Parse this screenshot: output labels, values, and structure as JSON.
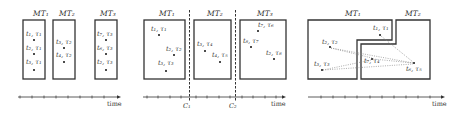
{
  "panels": [
    {
      "id": "a",
      "boxes": [
        {
          "title": "MT₁",
          "items": [
            "t₁, τ₁",
            "t₂, τ₁",
            "t₃, τ₁"
          ]
        },
        {
          "title": "MT₂",
          "items": [
            "t₃, τ₂",
            "t₄, τ₂"
          ]
        },
        {
          "title": "MT₃",
          "items": [
            "t₇, τ₃",
            "t₆, τ₃",
            "t₂, τ₃"
          ]
        }
      ],
      "axis_label": "time"
    },
    {
      "id": "b",
      "boxes": [
        {
          "title": "MT₁",
          "items": [
            "t₁, τ₁",
            "t₂, τ₂",
            "t₃, τ₃"
          ]
        },
        {
          "title": "MT₂",
          "items": [
            "t₃, τ₄",
            "t₄, τ₅"
          ]
        },
        {
          "title": "MT₃",
          "items": [
            "t₇, τ₆",
            "t₈, τ₇",
            "t₂, τ₈"
          ]
        }
      ],
      "cuts": [
        "C₁",
        "C₂"
      ],
      "axis_label": "time"
    },
    {
      "id": "c",
      "boxes": [
        {
          "title": "MT₁",
          "items": [
            "t₁, τ₁",
            "t₂, τ₂",
            "t₃, τ₃"
          ]
        },
        {
          "title": "MT₂",
          "items": [
            "t₇, τ₄",
            "t₆, τ₅"
          ]
        }
      ],
      "axis_label": "time"
    }
  ]
}
